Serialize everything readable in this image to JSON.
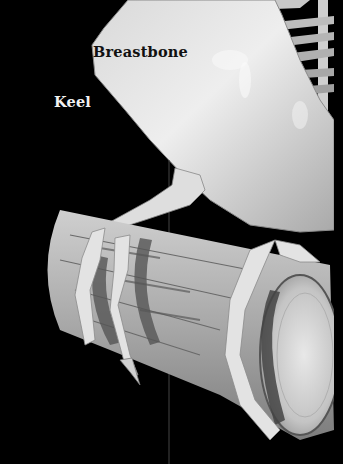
{
  "figure": {
    "style": "grayscale pencil illustration on black background",
    "colors": {
      "background": "#000000",
      "bone_light": "#e6e6e6",
      "bone_mid": "#bdbdbd",
      "bone_shadow": "#8a8a8a",
      "wood_light": "#c8c8c8",
      "wood_dark": "#5a5a5a"
    },
    "labels": [
      {
        "id": "breastbone",
        "text": "Breastbone",
        "color": "#111111"
      },
      {
        "id": "keel",
        "text": "Keel",
        "color": "#f2f2f2"
      }
    ],
    "parts": [
      "breastbone",
      "ribs",
      "spine",
      "leg",
      "toes",
      "claw",
      "perch"
    ]
  }
}
